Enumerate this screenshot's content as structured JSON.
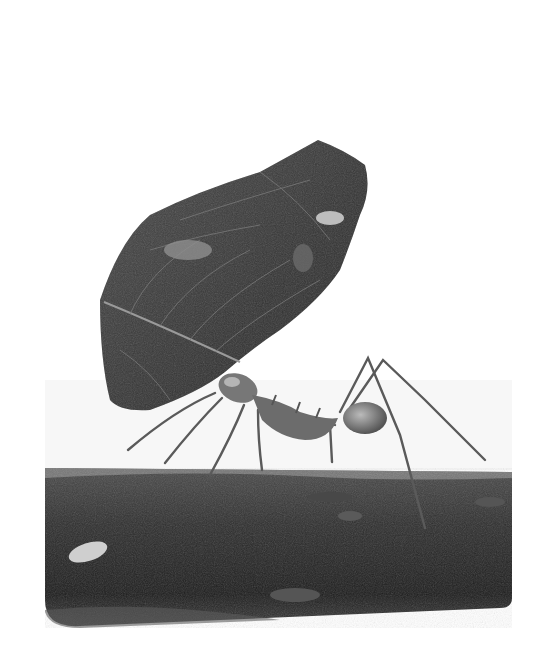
{
  "image": {
    "subject": "leaf-cutter ant carrying a leaf fragment on a branch",
    "style": "grayscale photograph",
    "background_color": "#ffffff",
    "colors": {
      "leaf": "#3a3a3a",
      "leaf_veins": "#8a8a8a",
      "branch": "#2a2a2a",
      "branch_top_moss": "#9a9a9a",
      "ant_body": "#6e6e6e",
      "ant_legs": "#5a5a5a"
    }
  }
}
